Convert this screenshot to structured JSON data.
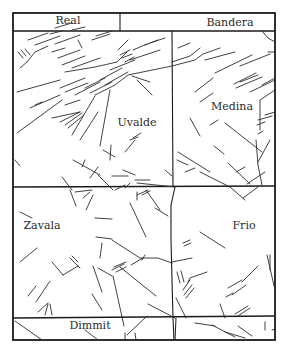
{
  "map": {
    "type": "county fault-line map",
    "colors": {
      "background": "#ffffff",
      "lines": "#1a1a1a",
      "text": "#2a2a2a"
    },
    "counties": [
      {
        "name": "Real",
        "label_x": 68,
        "label_y": 23
      },
      {
        "name": "Bandera",
        "label_x": 230,
        "label_y": 26
      },
      {
        "name": "Uvalde",
        "label_x": 137,
        "label_y": 125
      },
      {
        "name": "Medina",
        "label_x": 232,
        "label_y": 110
      },
      {
        "name": "Zavala",
        "label_x": 42,
        "label_y": 229
      },
      {
        "name": "Frio",
        "label_x": 244,
        "label_y": 229
      },
      {
        "name": "Dimmit",
        "label_x": 90,
        "label_y": 328
      }
    ]
  },
  "labels": {
    "real": "Real",
    "bandera": "Bandera",
    "uvalde": "Uvalde",
    "medina": "Medina",
    "zavala": "Zavala",
    "frio": "Frio",
    "dimmit": "Dimmit"
  }
}
